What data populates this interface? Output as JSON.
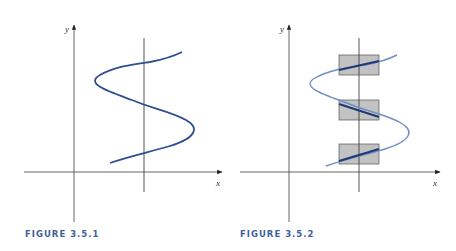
{
  "colors": {
    "axis": "#3a3a3a",
    "curve": "#2f4f8f",
    "curve_light": "#6f8fc5",
    "curve_dark": "#1f3a73",
    "box_fill": "#c2c2c2",
    "box_stroke": "#555555",
    "caption": "#3f5f99"
  },
  "figures": [
    {
      "caption": "FIGURE 3.5.1",
      "axis_labels": {
        "x": "x",
        "y": "y"
      },
      "description": "S-shaped curve crossed by a vertical line at three points"
    },
    {
      "caption": "FIGURE 3.5.2",
      "axis_labels": {
        "x": "x",
        "y": "y"
      },
      "description": "Same S-shaped curve with three shaded rectangles around the intersection points with the vertical line",
      "boxes": 3
    }
  ]
}
